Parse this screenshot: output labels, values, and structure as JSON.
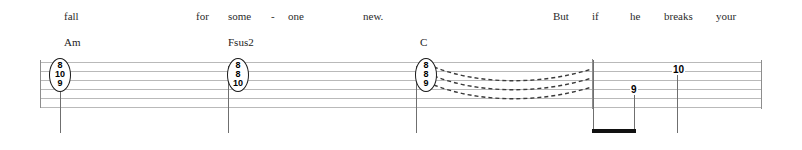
{
  "document": {
    "type": "guitar-tablature-with-lyrics",
    "staff_lines": 6
  },
  "lyrics": [
    {
      "text": "fall",
      "x": 64,
      "y": 10
    },
    {
      "text": "for",
      "x": 196,
      "y": 10
    },
    {
      "text": "some",
      "x": 228,
      "y": 10
    },
    {
      "text": "-",
      "x": 271,
      "y": 10
    },
    {
      "text": "one",
      "x": 288,
      "y": 10
    },
    {
      "text": "new.",
      "x": 363,
      "y": 10
    },
    {
      "text": "But",
      "x": 553,
      "y": 10
    },
    {
      "text": "if",
      "x": 592,
      "y": 10
    },
    {
      "text": "he",
      "x": 630,
      "y": 10
    },
    {
      "text": "breaks",
      "x": 664,
      "y": 10
    },
    {
      "text": "your",
      "x": 716,
      "y": 10
    }
  ],
  "chords": [
    {
      "name": "Am",
      "x": 64,
      "y": 36
    },
    {
      "name": "Fsus2",
      "x": 228,
      "y": 36
    },
    {
      "name": "C",
      "x": 420,
      "y": 36
    }
  ],
  "tab": {
    "chord_stacks": [
      {
        "label": "Am",
        "x": 60,
        "frets": [
          "8",
          "10",
          "9"
        ]
      },
      {
        "label": "Fsus2",
        "x": 228,
        "frets": [
          "8",
          "8",
          "10"
        ]
      },
      {
        "label": "C",
        "x": 416,
        "frets": [
          "8",
          "8",
          "9"
        ]
      }
    ],
    "single_notes": [
      {
        "fret": "9",
        "x": 631,
        "y": 86
      },
      {
        "fret": "10",
        "x": 674,
        "y": 66
      }
    ],
    "slur_curves": 3,
    "slur_style": "dashed"
  },
  "colors": {
    "staff_line": "#b9b9b9",
    "barline": "#8d8d8d",
    "note_text": "#000000",
    "lyric_text": "#2b2b2b",
    "beam": "#111111",
    "background": "#ffffff"
  }
}
